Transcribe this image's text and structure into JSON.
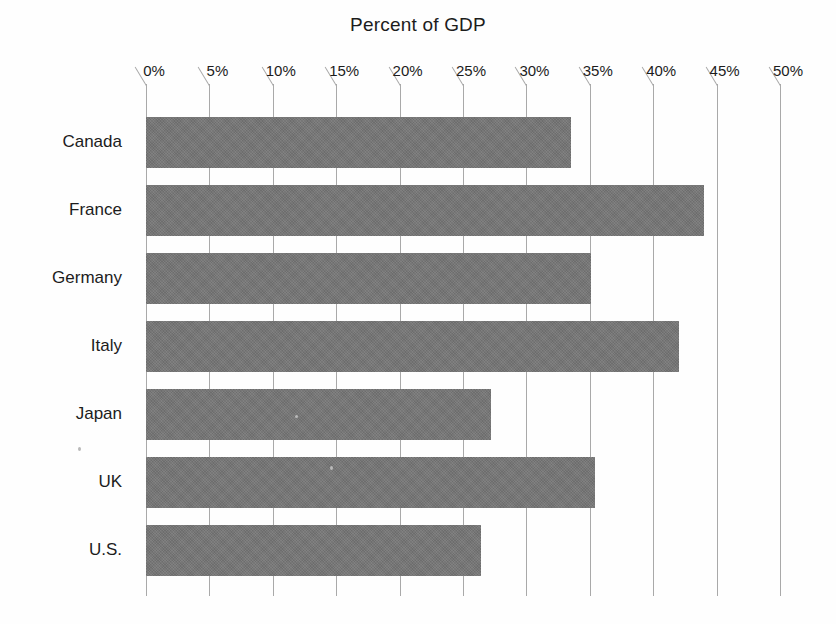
{
  "chart_data": {
    "type": "bar",
    "orientation": "horizontal",
    "title": "Percent of GDP",
    "xlabel": "",
    "ylabel": "",
    "categories": [
      "Canada",
      "France",
      "Germany",
      "Italy",
      "Japan",
      "UK",
      "U.S."
    ],
    "values": [
      33.5,
      44.0,
      35.1,
      42.0,
      27.2,
      35.4,
      26.4
    ],
    "series": [
      {
        "name": "Percent of GDP",
        "values": [
          33.5,
          44.0,
          35.1,
          42.0,
          27.2,
          35.4,
          26.4
        ]
      }
    ],
    "xlim": [
      0,
      50
    ],
    "ylim": null,
    "xticks": [
      0,
      5,
      10,
      15,
      20,
      25,
      30,
      35,
      40,
      45,
      50
    ],
    "xtick_labels": [
      "0%",
      "5%",
      "10%",
      "15%",
      "20%",
      "25%",
      "30%",
      "35%",
      "40%",
      "45%",
      "50%"
    ],
    "grid": true,
    "grid_axis": "x",
    "legend": false,
    "legend_position": "none",
    "bar_color": "#767676",
    "gridline_color": "#a9a9a9",
    "text_color": "#1c1c1c",
    "background_color": "#ffffff"
  }
}
